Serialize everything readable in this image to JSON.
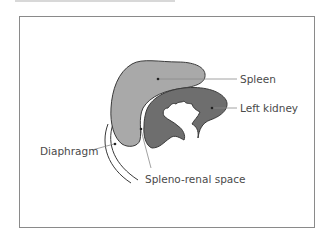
{
  "diagram": {
    "labels": {
      "spleen": "Spleen",
      "left_kidney": "Left kidney",
      "diaphragm": "Diaphragm",
      "spleno_renal_space": "Spleno-renal space"
    },
    "colors": {
      "spleen_fill": "#a9a9a9",
      "kidney_fill": "#6e6e6e",
      "outline": "#3a3a3a",
      "leader": "#8a8a8a",
      "frame": "#8a8a8a"
    }
  }
}
